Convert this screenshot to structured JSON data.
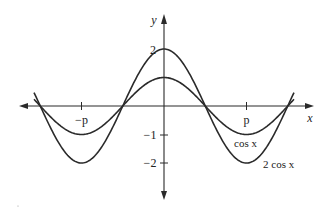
{
  "chart_data": {
    "type": "line",
    "title": "",
    "xlabel": "x",
    "ylabel": "y",
    "x_ticks": [
      {
        "value": -3.14159,
        "label": "−p"
      },
      {
        "value": 3.14159,
        "label": "p"
      }
    ],
    "y_ticks": [
      {
        "value": 2,
        "label": "2"
      },
      {
        "value": -1,
        "label": "−1"
      },
      {
        "value": -2,
        "label": "−2"
      }
    ],
    "xlim": [
      -4.95,
      4.95
    ],
    "ylim": [
      -2.2,
      2.2
    ],
    "grid": false,
    "legend": "inline labels near curves at x≈π",
    "series": [
      {
        "name": "cos x",
        "label": "cos x",
        "amplitude": 1,
        "x": [
          -4.95,
          -4.712,
          -3.927,
          -3.14159,
          -2.356,
          -1.5708,
          -0.785,
          0,
          0.785,
          1.5708,
          2.356,
          3.14159,
          3.927,
          4.712,
          4.95
        ],
        "y": [
          0.236,
          0,
          -0.707,
          -1,
          -0.707,
          0,
          0.707,
          1,
          0.707,
          0,
          -0.707,
          -1,
          -0.707,
          0,
          0.236
        ]
      },
      {
        "name": "2 cos x",
        "label": "2 cos x",
        "amplitude": 2,
        "x": [
          -4.95,
          -4.712,
          -3.927,
          -3.14159,
          -2.356,
          -1.5708,
          -0.785,
          0,
          0.785,
          1.5708,
          2.356,
          3.14159,
          3.927,
          4.712,
          4.95
        ],
        "y": [
          0.472,
          0,
          -1.414,
          -2,
          -1.414,
          0,
          1.414,
          2,
          1.414,
          0,
          -1.414,
          -2,
          -1.414,
          0,
          0.472
        ]
      }
    ]
  },
  "labels": {
    "y_axis": "y",
    "x_axis": "x",
    "tick_neg_pi": "−p",
    "tick_pi": "p",
    "tick_y2": "2",
    "tick_yneg1": "−1",
    "tick_yneg2": "−2",
    "curve_cos": "cos x",
    "curve_2cos": "2 cos x"
  },
  "colors": {
    "line": "#2a2a2a",
    "background": "#ffffff"
  }
}
